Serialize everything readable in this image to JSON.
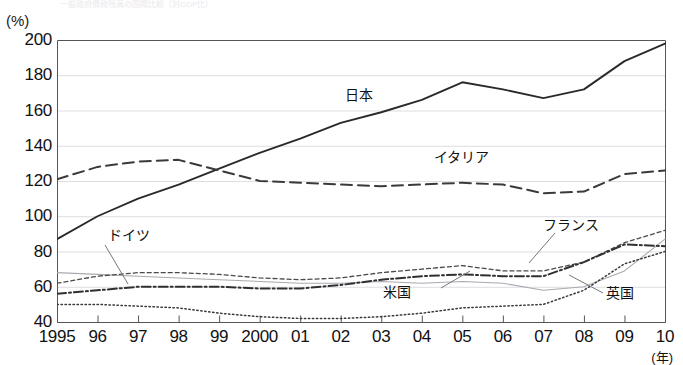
{
  "title": "一般政府債務残高の国際比較（対GDP比）",
  "axes": {
    "y_unit": "(%)",
    "x_unit": "(年)",
    "y_ticks": [
      "200",
      "180",
      "160",
      "140",
      "120",
      "100",
      "80",
      "60",
      "40"
    ],
    "x_ticks": [
      "1995",
      "96",
      "97",
      "98",
      "99",
      "2000",
      "01",
      "02",
      "03",
      "04",
      "05",
      "06",
      "07",
      "08",
      "09",
      "10"
    ]
  },
  "series_labels": {
    "japan": "日本",
    "italy": "イタリア",
    "germany": "ドイツ",
    "france": "フランス",
    "usa": "米国",
    "uk": "英国"
  },
  "chart_data": {
    "type": "line",
    "title": "一般政府債務残高の国際比較（対GDP比）",
    "xlabel": "(年)",
    "ylabel": "(%)",
    "ylim": [
      40,
      200
    ],
    "grid": true,
    "legend": "inline-annotations",
    "x": [
      "1995",
      "96",
      "97",
      "98",
      "99",
      "2000",
      "01",
      "02",
      "03",
      "04",
      "05",
      "06",
      "07",
      "08",
      "09",
      "10"
    ],
    "series": [
      {
        "name": "日本",
        "style": "solid",
        "values": [
          87,
          100,
          110,
          118,
          127,
          136,
          144,
          153,
          159,
          166,
          176,
          172,
          167,
          172,
          188,
          198
        ]
      },
      {
        "name": "イタリア",
        "style": "long-dashed",
        "values": [
          121,
          128,
          131,
          132,
          126,
          120,
          119,
          118,
          117,
          118,
          119,
          118,
          113,
          114,
          124,
          126
        ]
      },
      {
        "name": "ドイツ",
        "style": "thin-solid",
        "values": [
          68,
          67,
          66,
          65,
          64,
          63,
          62,
          62,
          63,
          62,
          63,
          62,
          58,
          60,
          69,
          87
        ]
      },
      {
        "name": "フランス",
        "style": "short-dashed",
        "values": [
          62,
          66,
          68,
          68,
          67,
          65,
          64,
          65,
          68,
          70,
          72,
          69,
          69,
          74,
          85,
          92
        ]
      },
      {
        "name": "米国",
        "style": "dash-dot",
        "values": [
          56,
          58,
          60,
          60,
          60,
          59,
          59,
          61,
          64,
          66,
          67,
          66,
          66,
          74,
          84,
          83
        ]
      },
      {
        "name": "英国",
        "style": "dotted",
        "values": [
          50,
          50,
          49,
          48,
          45,
          43,
          42,
          42,
          43,
          45,
          48,
          49,
          50,
          58,
          73,
          80
        ]
      }
    ]
  }
}
